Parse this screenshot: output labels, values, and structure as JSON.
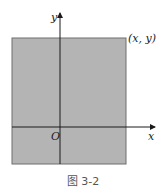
{
  "figure": {
    "caption": "图 3-2",
    "labels": {
      "y_axis": "y",
      "x_axis": "x",
      "origin": "O",
      "corner_point": "(x, y)"
    },
    "colors": {
      "region_fill": "#b4b4b4",
      "region_edge": "#6e6e6e",
      "axis": "#1a1a1a"
    }
  }
}
